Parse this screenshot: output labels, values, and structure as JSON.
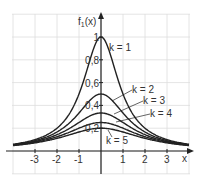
{
  "chart_data": {
    "type": "line",
    "title": "",
    "xlabel": "x",
    "ylabel": "f1(x)",
    "xlim": [
      -4,
      4
    ],
    "ylim": [
      0,
      1.2
    ],
    "grid": true,
    "x_ticks": [
      "-3",
      "-2",
      "-1",
      "1",
      "2",
      "3"
    ],
    "y_ticks": [
      "0,2",
      "0,4",
      "0,6",
      "0,8",
      "1"
    ],
    "series": [
      {
        "name": "k = 1",
        "formula": "1/(1+x^2)",
        "peak": 1.0
      },
      {
        "name": "k = 2",
        "formula": "1/(2+x^2)",
        "peak": 0.5
      },
      {
        "name": "k = 3",
        "formula": "1/(3+x^2)",
        "peak": 0.333
      },
      {
        "name": "k = 4",
        "formula": "1/(4+x^2)",
        "peak": 0.25
      },
      {
        "name": "k = 5",
        "formula": "1/(5+x^2)",
        "peak": 0.2
      }
    ]
  },
  "labels": {
    "ylabel_main": "f",
    "ylabel_sub": "1",
    "ylabel_tail": "(x)",
    "xlabel": "x",
    "k1": "k = 1",
    "k2": "k = 2",
    "k3": "k = 3",
    "k4": "k = 4",
    "k5": "k = 5",
    "xt": [
      "-3",
      "-2",
      "-1",
      "1",
      "2",
      "3"
    ],
    "yt": [
      "0,2",
      "0,4",
      "0,6",
      "0,8",
      "1"
    ]
  }
}
